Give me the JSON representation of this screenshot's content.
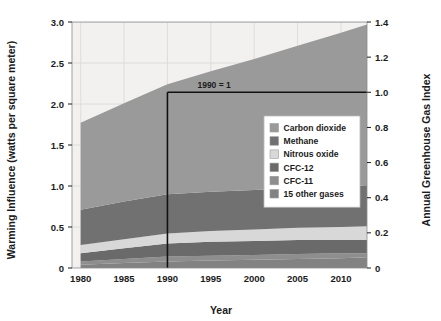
{
  "chart_data": {
    "type": "area",
    "stacked": true,
    "title": "",
    "xlabel": "Year",
    "ylabel": "Warming Influence (watts per square meter)",
    "y2label": "Annual Greenhouse Gas Index",
    "xlim": [
      1979,
      2013
    ],
    "ylim": [
      0,
      3.0
    ],
    "y2lim": [
      0,
      1.4
    ],
    "xticks": [
      1980,
      1985,
      1990,
      1995,
      2000,
      2005,
      2010
    ],
    "xtick_labels": [
      "1980",
      "1985",
      "1990",
      "1995",
      "2000",
      "2005",
      "2010"
    ],
    "yticks": [
      0,
      0.5,
      1.0,
      1.5,
      2.0,
      2.5,
      3.0
    ],
    "ytick_labels": [
      "0",
      "0.5",
      "1.0",
      "1.5",
      "2.0",
      "2.5",
      "3.0"
    ],
    "y2ticks": [
      0,
      0.2,
      0.4,
      0.6,
      0.8,
      1.0,
      1.2,
      1.4
    ],
    "y2tick_labels": [
      "0",
      "0.2",
      "0.4",
      "0.6",
      "0.8",
      "1.0",
      "1.2",
      "1.4"
    ],
    "grid": true,
    "legend_position": "center-right",
    "x": [
      1980,
      1985,
      1990,
      1995,
      2000,
      2005,
      2010,
      2013
    ],
    "series": [
      {
        "name": "Carbon dioxide",
        "color": "#9a9a9a",
        "values": [
          1.06,
          1.2,
          1.34,
          1.47,
          1.6,
          1.74,
          1.88,
          1.96
        ]
      },
      {
        "name": "Methane",
        "color": "#717171",
        "values": [
          0.43,
          0.46,
          0.48,
          0.48,
          0.48,
          0.48,
          0.49,
          0.5
        ]
      },
      {
        "name": "Nitrous oxide",
        "color": "#d8d8d8",
        "values": [
          0.1,
          0.11,
          0.12,
          0.13,
          0.14,
          0.15,
          0.16,
          0.17
        ]
      },
      {
        "name": "CFC-12",
        "color": "#6a6a6a",
        "values": [
          0.1,
          0.13,
          0.16,
          0.17,
          0.17,
          0.17,
          0.16,
          0.16
        ]
      },
      {
        "name": "CFC-11",
        "color": "#8e8e8e",
        "values": [
          0.04,
          0.05,
          0.06,
          0.06,
          0.06,
          0.06,
          0.06,
          0.05
        ]
      },
      {
        "name": "15 other gases",
        "color": "#828282",
        "values": [
          0.04,
          0.06,
          0.08,
          0.09,
          0.1,
          0.11,
          0.12,
          0.13
        ]
      }
    ],
    "annotations": [
      {
        "name": "reference-1990",
        "text": "1990 = 1",
        "x": 1990,
        "y2": 1.0
      }
    ],
    "legend_entries": [
      {
        "label": "Carbon dioxide",
        "color": "#9a9a9a"
      },
      {
        "label": "Methane",
        "color": "#717171"
      },
      {
        "label": "Nitrous oxide",
        "color": "#d8d8d8"
      },
      {
        "label": "CFC-12",
        "color": "#6a6a6a"
      },
      {
        "label": "CFC-11",
        "color": "#8e8e8e"
      },
      {
        "label": "15 other gases",
        "color": "#828282"
      }
    ],
    "colors": {
      "plot_background": "#f2f1ef",
      "grid": "#dcdad6",
      "axis_text": "#1b1b1b",
      "reference_line": "#111111",
      "legend_background": "#ffffff"
    }
  }
}
